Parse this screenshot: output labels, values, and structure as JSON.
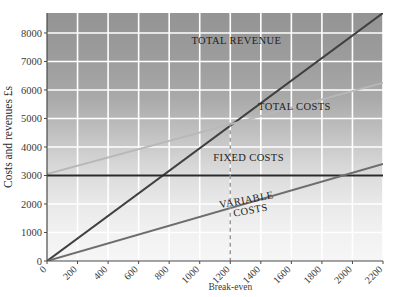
{
  "chart_data": {
    "type": "line",
    "title": "",
    "subtitle": "",
    "xlabel": "",
    "ylabel": "Costs and revenues £s",
    "xlim": [
      0,
      2200
    ],
    "ylim": [
      0,
      8700
    ],
    "grid": true,
    "legend_position": "inline-annotations",
    "x_ticks": [
      "0",
      "200",
      "400",
      "600",
      "800",
      "1000",
      "1200",
      "1400",
      "1600",
      "1800",
      "2000",
      "2200"
    ],
    "x_tick_values": [
      0,
      200,
      400,
      600,
      800,
      1000,
      1200,
      1400,
      1600,
      1800,
      2000,
      2200
    ],
    "y_ticks": [
      "0",
      "1000",
      "2000",
      "3000",
      "4000",
      "5000",
      "6000",
      "7000",
      "8000"
    ],
    "y_tick_values": [
      0,
      1000,
      2000,
      3000,
      4000,
      5000,
      6000,
      7000,
      8000
    ],
    "x": [
      0,
      2200
    ],
    "series": [
      {
        "name": "TOTAL REVENUE",
        "values": [
          0,
          8700
        ],
        "color": "#3f3f3f",
        "label_x": 1240,
        "label_y": 7600
      },
      {
        "name": "TOTAL COSTS",
        "values": [
          3050,
          6250
        ],
        "color": "#b8b8b8",
        "label_x": 1620,
        "label_y": 5300
      },
      {
        "name": "FIXED COSTS",
        "values": [
          3000,
          3000
        ],
        "color": "#2a2a2a",
        "label_x": 1320,
        "label_y": 3520
      },
      {
        "name": "VARIABLE COSTS",
        "values": [
          0,
          3400
        ],
        "color": "#6d6d6d",
        "label_x": 1310,
        "label_y": 2030
      }
    ],
    "annotations": [
      {
        "name": "break-even",
        "label": "Break-even",
        "x": 1200,
        "y": 4850,
        "style": "dashed-vertical",
        "color": "#9a9a9a"
      }
    ]
  },
  "labels": {
    "variable_costs_line1": "VARIABLE",
    "variable_costs_line2": "COSTS"
  },
  "colors": {
    "plot_bg_top": "#9d9d9d",
    "plot_bg_bottom": "#f2f2f2",
    "gridline": "#ffffff",
    "axis": "#4a4a4a",
    "total_revenue": "#3f3f3f",
    "total_costs": "#b8b8b8",
    "fixed_costs": "#2a2a2a",
    "variable_costs": "#6d6d6d",
    "breakeven": "#9a9a9a"
  }
}
